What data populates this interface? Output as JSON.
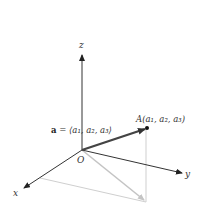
{
  "diagram": {
    "type": "3d-vector-position-diagram",
    "axes": {
      "x": {
        "label": "x"
      },
      "y": {
        "label": "y"
      },
      "z": {
        "label": "z"
      }
    },
    "origin": {
      "label": "O"
    },
    "point": {
      "label_prefix": "A",
      "label_coords": "(a1, a2, a3)",
      "display": "A(a₁, a₂, a₃)"
    },
    "vector": {
      "name": "a",
      "equals": " = ",
      "components_display": "⟨a₁, a₂, a₃⟩"
    },
    "colors": {
      "axis": "#333333",
      "vector": "#444444",
      "projection": "#c8c8c8",
      "projection_vector": "#bdbdbd"
    }
  }
}
